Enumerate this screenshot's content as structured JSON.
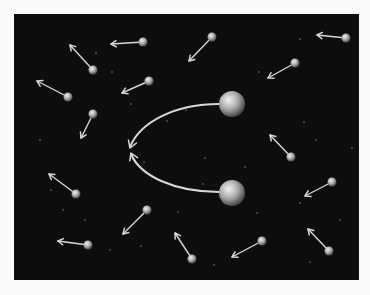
{
  "figure": {
    "background": "#fafafa",
    "panel": {
      "x": 14,
      "y": 14,
      "width": 345,
      "height": 266,
      "color": "#0d0d0d"
    },
    "colors": {
      "arrow": "#d8d8d8",
      "sphere_light": "#f2f2f2",
      "sphere_mid": "#a8a8a8",
      "sphere_dark": "#4a4a4a",
      "star": "#9a9a9a"
    },
    "large_spheres": [
      {
        "id": "top",
        "cx": 232,
        "cy": 104,
        "r": 13
      },
      {
        "id": "bottom",
        "cx": 232,
        "cy": 193,
        "r": 13
      }
    ],
    "attraction_curves": [
      {
        "id": "top-curve",
        "path": "M219,104 C175,104 140,122 130,147",
        "tip": [
          130,
          148
        ],
        "dir": [
          -0.35,
          0.94
        ]
      },
      {
        "id": "bottom-curve",
        "path": "M219,192 C175,192 140,176 131,154",
        "tip": [
          131,
          153
        ],
        "dir": [
          -0.38,
          -0.92
        ]
      }
    ],
    "small_particles": [
      {
        "cx": 143,
        "cy": 42,
        "tx": 111,
        "ty": 44
      },
      {
        "cx": 93,
        "cy": 70,
        "tx": 70,
        "ty": 45
      },
      {
        "cx": 68,
        "cy": 97,
        "tx": 37,
        "ty": 81
      },
      {
        "cx": 149,
        "cy": 81,
        "tx": 122,
        "ty": 93
      },
      {
        "cx": 93,
        "cy": 114,
        "tx": 81,
        "ty": 138
      },
      {
        "cx": 212,
        "cy": 37,
        "tx": 189,
        "ty": 61
      },
      {
        "cx": 346,
        "cy": 38,
        "tx": 317,
        "ty": 35
      },
      {
        "cx": 295,
        "cy": 63,
        "tx": 268,
        "ty": 78
      },
      {
        "cx": 76,
        "cy": 194,
        "tx": 49,
        "ty": 174
      },
      {
        "cx": 147,
        "cy": 210,
        "tx": 123,
        "ty": 234
      },
      {
        "cx": 88,
        "cy": 245,
        "tx": 58,
        "ty": 241
      },
      {
        "cx": 192,
        "cy": 259,
        "tx": 175,
        "ty": 233
      },
      {
        "cx": 291,
        "cy": 157,
        "tx": 270,
        "ty": 135
      },
      {
        "cx": 332,
        "cy": 182,
        "tx": 305,
        "ty": 196
      },
      {
        "cx": 262,
        "cy": 241,
        "tx": 232,
        "ty": 257
      },
      {
        "cx": 329,
        "cy": 251,
        "tx": 308,
        "ty": 229
      }
    ],
    "small_particle_radius": 4.5,
    "stars": [
      [
        96,
        53
      ],
      [
        112,
        72
      ],
      [
        131,
        104
      ],
      [
        144,
        162
      ],
      [
        167,
        121
      ],
      [
        186,
        110
      ],
      [
        205,
        158
      ],
      [
        259,
        72
      ],
      [
        304,
        122
      ],
      [
        316,
        140
      ],
      [
        245,
        167
      ],
      [
        203,
        184
      ],
      [
        257,
        213
      ],
      [
        340,
        220
      ],
      [
        300,
        203
      ],
      [
        51,
        190
      ],
      [
        63,
        210
      ],
      [
        85,
        220
      ],
      [
        110,
        250
      ],
      [
        141,
        246
      ],
      [
        310,
        262
      ],
      [
        178,
        212
      ],
      [
        214,
        265
      ],
      [
        352,
        148
      ],
      [
        40,
        140
      ],
      [
        300,
        39
      ]
    ]
  }
}
